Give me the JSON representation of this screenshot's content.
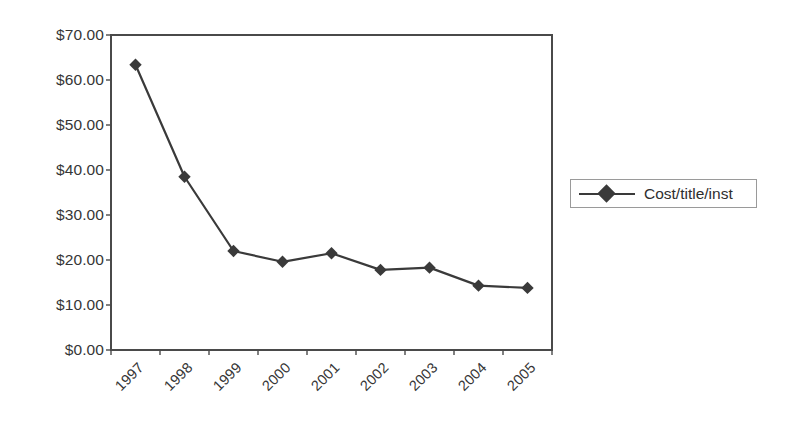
{
  "chart_data": {
    "type": "line",
    "title": "",
    "xlabel": "",
    "ylabel": "",
    "categories": [
      "1997",
      "1998",
      "1999",
      "2000",
      "2001",
      "2002",
      "2003",
      "2004",
      "2005"
    ],
    "series": [
      {
        "name": "Cost/title/inst",
        "values": [
          63.4,
          38.5,
          22.0,
          19.6,
          21.5,
          17.8,
          18.3,
          14.3,
          13.8
        ],
        "color": "#3a3a3a",
        "marker": "diamond"
      }
    ],
    "ylim": [
      0,
      70
    ],
    "ytick_step": 10,
    "ytick_labels": [
      "$0.00",
      "$10.00",
      "$20.00",
      "$30.00",
      "$40.00",
      "$50.00",
      "$60.00",
      "$70.00"
    ],
    "ytick_values": [
      0,
      10,
      20,
      30,
      40,
      50,
      60,
      70
    ],
    "grid": "horizontal",
    "grid_color": "#c9c9c9",
    "axis_color": "#4a4a4a",
    "plot_background": "#ffffff",
    "legend_position": "right",
    "xtick_rotation": -45
  },
  "legend": {
    "entries": [
      {
        "label": "Cost/title/inst"
      }
    ]
  },
  "icons": {
    "diamond_marker": "diamond-marker-icon"
  }
}
